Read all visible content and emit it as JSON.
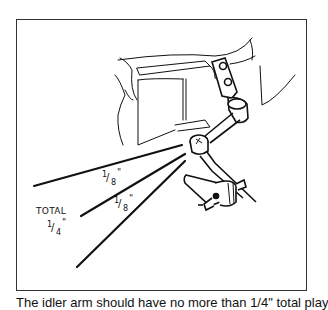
{
  "figure": {
    "labels": {
      "total": "TOTAL",
      "total_value": "1/4\"",
      "upper_play": "1/8\"",
      "lower_play": "1/8\""
    },
    "fractions": {
      "upper": {
        "num": "1",
        "den": "8",
        "mark": "\""
      },
      "lower": {
        "num": "1",
        "den": "8",
        "mark": "\""
      },
      "total": {
        "num": "1",
        "den": "4",
        "mark": "\""
      }
    }
  },
  "caption": {
    "text": "The idler arm should have no more than 1/4\" total play"
  }
}
